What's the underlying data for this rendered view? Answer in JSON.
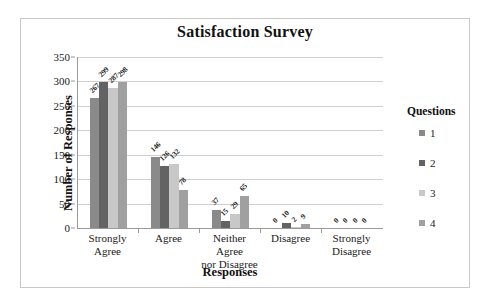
{
  "chart_data": {
    "type": "bar",
    "title": "Satisfaction Survey",
    "xlabel": "Responses",
    "ylabel": "Number of Responses",
    "ylim": [
      0,
      350
    ],
    "ytick_step": 50,
    "yticks": [
      "0",
      "50",
      "100",
      "150",
      "200",
      "250",
      "300",
      "350"
    ],
    "grid": true,
    "legend_position": "right",
    "legend_title": "Questions",
    "categories": [
      "Strongly Agree",
      "Agree",
      "Neither Agree nor Disagree",
      "Disagree",
      "Strongly Disagree"
    ],
    "category_lines": [
      [
        "Strongly",
        "Agree"
      ],
      [
        "Agree",
        ""
      ],
      [
        "Neither Agree",
        "nor Disagree"
      ],
      [
        "Disagree",
        ""
      ],
      [
        "Strongly",
        "Disagree"
      ]
    ],
    "series": [
      {
        "name": "1",
        "color": "#8a8a8a",
        "values": [
          267,
          146,
          37,
          0,
          0
        ]
      },
      {
        "name": "2",
        "color": "#636363",
        "values": [
          299,
          126,
          15,
          10,
          0
        ]
      },
      {
        "name": "3",
        "color": "#c8c8c8",
        "values": [
          287,
          132,
          29,
          2,
          0
        ]
      },
      {
        "name": "4",
        "color": "#a0a0a0",
        "values": [
          298,
          78,
          65,
          9,
          0
        ]
      }
    ]
  },
  "colors": {
    "series_1": "#8a8a8a",
    "series_2": "#636363",
    "series_3": "#c8c8c8",
    "series_4": "#a0a0a0",
    "frame_border": "#c9c9c9",
    "axis": "#9a9a9a",
    "gridline": "#cfcfcf",
    "text": "#1a1a1a"
  }
}
